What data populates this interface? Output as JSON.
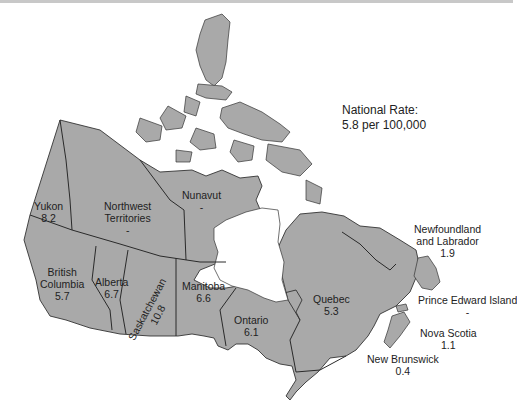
{
  "national_rate": {
    "label": "National Rate:",
    "value": "5.8 per 100,000"
  },
  "colors": {
    "land": "#a9a9a9",
    "border": "#333333",
    "water": "#ffffff"
  },
  "provinces": [
    {
      "id": "yukon",
      "name": "Yukon",
      "rate": "8.2"
    },
    {
      "id": "northwest-territories",
      "name_line1": "Northwest",
      "name_line2": "Territories",
      "rate": "-"
    },
    {
      "id": "nunavut",
      "name": "Nunavut",
      "rate": "-"
    },
    {
      "id": "british-columbia",
      "name_line1": "British",
      "name_line2": "Columbia",
      "rate": "5.7"
    },
    {
      "id": "alberta",
      "name": "Alberta",
      "rate": "6.7"
    },
    {
      "id": "saskatchewan",
      "name": "Saskatchewan",
      "rate": "10.8"
    },
    {
      "id": "manitoba",
      "name": "Manitoba",
      "rate": "6.6"
    },
    {
      "id": "ontario",
      "name": "Ontario",
      "rate": "6.1"
    },
    {
      "id": "quebec",
      "name": "Quebec",
      "rate": "5.3"
    },
    {
      "id": "newfoundland-labrador",
      "name_line1": "Newfoundland",
      "name_line2": "and Labrador",
      "rate": "1.9"
    },
    {
      "id": "prince-edward-island",
      "name": "Prince Edward Island",
      "rate": "-"
    },
    {
      "id": "nova-scotia",
      "name": "Nova Scotia",
      "rate": "1.1"
    },
    {
      "id": "new-brunswick",
      "name": "New Brunswick",
      "rate": "0.4"
    }
  ]
}
